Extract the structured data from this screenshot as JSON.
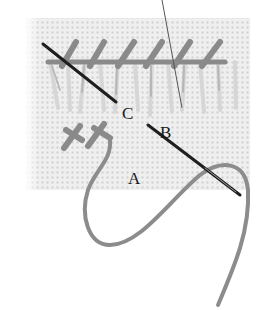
{
  "figure": {
    "labels": {
      "a": "A",
      "b": "B",
      "c": "C"
    },
    "colors": {
      "background": "#ffffff",
      "canvas": "#ececec",
      "canvas_holes": "#c8c8c8",
      "thread": "#8a8a8a",
      "needle": "#1e1e1e"
    }
  }
}
